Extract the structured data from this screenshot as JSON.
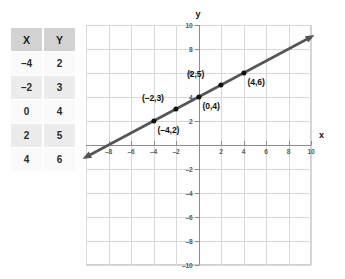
{
  "table": {
    "headers": [
      "X",
      "Y"
    ],
    "rows": [
      [
        "–4",
        "2"
      ],
      [
        "–2",
        "3"
      ],
      [
        "0",
        "4"
      ],
      [
        "2",
        "5"
      ],
      [
        "4",
        "6"
      ]
    ]
  },
  "chart_data": {
    "type": "line",
    "title": "",
    "xlabel": "x",
    "ylabel": "y",
    "xlim": [
      -10,
      10
    ],
    "ylim": [
      -10,
      10
    ],
    "grid": true,
    "grid_step": 2,
    "legend": "none",
    "xticks": [
      -8,
      -6,
      -4,
      -2,
      2,
      4,
      6,
      8,
      10
    ],
    "yticks": [
      -10,
      -8,
      -6,
      -4,
      -2,
      2,
      4,
      6,
      8,
      10
    ],
    "xtick_labels": [
      "–8",
      "–6",
      "–4",
      "–2",
      "2",
      "4",
      "6",
      "8",
      "10"
    ],
    "ytick_labels": [
      "–10",
      "–8",
      "–6",
      "–4",
      "–2",
      "2",
      "4",
      "6",
      "8",
      "10"
    ],
    "series": [
      {
        "name": "y = x/2 + 4",
        "slope": 0.5,
        "intercept": 4,
        "x": [
          -10,
          10
        ],
        "values": [
          -1,
          9
        ],
        "arrows": "both",
        "color": "#555555"
      }
    ],
    "points": [
      {
        "x": -4,
        "y": 2,
        "label": "(–4,2)",
        "label_pos": "below-right"
      },
      {
        "x": -2,
        "y": 3,
        "label": "(–2,3)",
        "label_pos": "above-left"
      },
      {
        "x": 0,
        "y": 4,
        "label": "(0,4)",
        "label_pos": "below-right"
      },
      {
        "x": 2,
        "y": 5,
        "label": "(2,5)",
        "label_pos": "above-left"
      },
      {
        "x": 4,
        "y": 6,
        "label": "(4,6)",
        "label_pos": "below-right"
      }
    ],
    "colors": {
      "line": "#555555",
      "point": "#111111",
      "grid": "#d8d8d8",
      "axis": "#8c8c8c"
    }
  }
}
